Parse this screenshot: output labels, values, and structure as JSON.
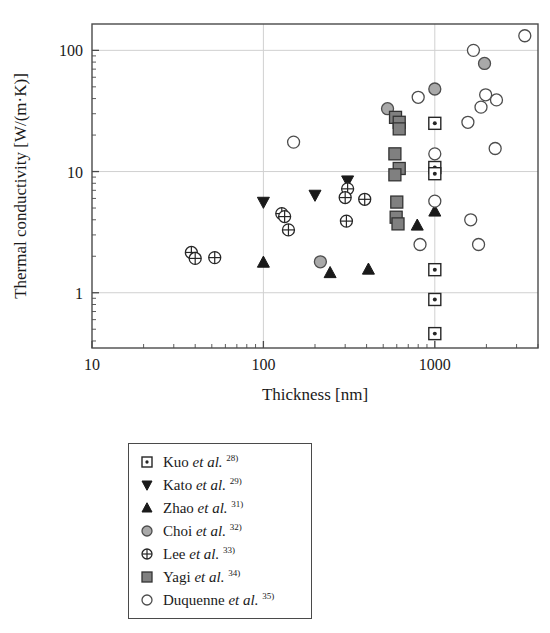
{
  "chart_data": {
    "type": "scatter",
    "title": "",
    "xlabel": "Thickness [nm]",
    "ylabel": "Thermal conductivity [W/(m·K)]",
    "xscale": "log",
    "yscale": "log",
    "xlim": [
      10,
      4000
    ],
    "ylim": [
      0.35,
      165
    ],
    "xticks": [
      "10",
      "100",
      "1000"
    ],
    "xtick_values": [
      10,
      100,
      1000
    ],
    "yticks": [
      "1",
      "10",
      "100"
    ],
    "ytick_values": [
      1,
      10,
      100
    ],
    "grid": "major gridlines at x=100, x=1000, y=1, y=10, y=100",
    "legend_position": "below plot, centered box",
    "series": [
      {
        "name": "Kuo et al.",
        "ref": "28)",
        "marker": "square-dot",
        "fill": "#ffffff",
        "stroke": "#262626",
        "points": [
          {
            "x": 1000,
            "y": 25.0
          },
          {
            "x": 1000,
            "y": 10.8
          },
          {
            "x": 1000,
            "y": 9.6
          },
          {
            "x": 1000,
            "y": 1.55
          },
          {
            "x": 1000,
            "y": 0.88
          },
          {
            "x": 1000,
            "y": 0.46
          }
        ]
      },
      {
        "name": "Kato et al.",
        "ref": "29)",
        "marker": "triangle-down",
        "fill": "#1a1a1a",
        "stroke": "#1a1a1a",
        "points": [
          {
            "x": 100,
            "y": 5.6
          },
          {
            "x": 200,
            "y": 6.4
          },
          {
            "x": 310,
            "y": 8.4
          }
        ]
      },
      {
        "name": "Zhao et al.",
        "ref": "31)",
        "marker": "triangle-up",
        "fill": "#1a1a1a",
        "stroke": "#1a1a1a",
        "points": [
          {
            "x": 100,
            "y": 1.78
          },
          {
            "x": 245,
            "y": 1.46
          },
          {
            "x": 410,
            "y": 1.56
          },
          {
            "x": 790,
            "y": 3.6
          },
          {
            "x": 1000,
            "y": 4.7
          }
        ]
      },
      {
        "name": "Choi et al.",
        "ref": "32)",
        "marker": "circle",
        "fill": "#a9a9a9",
        "stroke": "#4d4d4d",
        "points": [
          {
            "x": 215,
            "y": 1.8
          },
          {
            "x": 530,
            "y": 33.0
          },
          {
            "x": 1000,
            "y": 48.0
          },
          {
            "x": 1950,
            "y": 78.0
          }
        ]
      },
      {
        "name": "Lee et al.",
        "ref": "33)",
        "marker": "circle-cross",
        "fill": "#ffffff",
        "stroke": "#262626",
        "points": [
          {
            "x": 38,
            "y": 2.15
          },
          {
            "x": 40,
            "y": 1.92
          },
          {
            "x": 52,
            "y": 1.95
          },
          {
            "x": 128,
            "y": 4.5
          },
          {
            "x": 133,
            "y": 4.25
          },
          {
            "x": 140,
            "y": 3.3
          },
          {
            "x": 310,
            "y": 7.2
          },
          {
            "x": 300,
            "y": 6.1
          },
          {
            "x": 305,
            "y": 3.9
          },
          {
            "x": 390,
            "y": 5.9
          }
        ]
      },
      {
        "name": "Yagi et al.",
        "ref": "34)",
        "marker": "square",
        "fill": "#808080",
        "stroke": "#333333",
        "points": [
          {
            "x": 590,
            "y": 28.0
          },
          {
            "x": 620,
            "y": 25.5
          },
          {
            "x": 620,
            "y": 22.5
          },
          {
            "x": 585,
            "y": 14.0
          },
          {
            "x": 620,
            "y": 10.6
          },
          {
            "x": 585,
            "y": 9.4
          },
          {
            "x": 600,
            "y": 5.6
          },
          {
            "x": 595,
            "y": 4.2
          },
          {
            "x": 610,
            "y": 3.7
          }
        ]
      },
      {
        "name": "Duquenne et al.",
        "ref": "35)",
        "marker": "circle-open",
        "fill": "#ffffff",
        "stroke": "#4d4d4d",
        "points": [
          {
            "x": 150,
            "y": 17.5
          },
          {
            "x": 800,
            "y": 41.0
          },
          {
            "x": 1000,
            "y": 14.0
          },
          {
            "x": 1000,
            "y": 5.7
          },
          {
            "x": 820,
            "y": 2.5
          },
          {
            "x": 1680,
            "y": 100.0
          },
          {
            "x": 1560,
            "y": 25.5
          },
          {
            "x": 1860,
            "y": 34.0
          },
          {
            "x": 1980,
            "y": 43.0
          },
          {
            "x": 2290,
            "y": 39.0
          },
          {
            "x": 2250,
            "y": 15.5
          },
          {
            "x": 1620,
            "y": 4.0
          },
          {
            "x": 1800,
            "y": 2.5
          },
          {
            "x": 3350,
            "y": 132.0
          }
        ]
      }
    ]
  },
  "legend": {
    "items": [
      {
        "label": "Kuo ",
        "etal": "et al.",
        "ref": "28)",
        "marker": "square-dot"
      },
      {
        "label": "Kato ",
        "etal": "et al.",
        "ref": "29)",
        "marker": "triangle-down"
      },
      {
        "label": "Zhao ",
        "etal": "et al.",
        "ref": "31)",
        "marker": "triangle-up"
      },
      {
        "label": "Choi ",
        "etal": "et al.",
        "ref": "32)",
        "marker": "circle-filled"
      },
      {
        "label": "Lee ",
        "etal": "et al.",
        "ref": "33)",
        "marker": "circle-cross"
      },
      {
        "label": "Yagi ",
        "etal": "et al.",
        "ref": "34)",
        "marker": "square-filled"
      },
      {
        "label": "Duquenne ",
        "etal": "et al.",
        "ref": "35)",
        "marker": "circle-open"
      }
    ]
  },
  "colors": {
    "axis": "#4a4a4a",
    "grid": "#d0d0d0",
    "ink": "#1a1a1a",
    "choi_fill": "#a9a9a9",
    "yagi_fill": "#808080"
  }
}
